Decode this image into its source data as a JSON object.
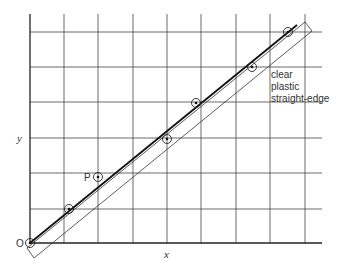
{
  "figure": {
    "type": "diagram",
    "axes": {
      "x_label": "x",
      "y_label": "y",
      "origin_label": "O"
    },
    "grid": {
      "x_lines": [
        30,
        64,
        98,
        133,
        167,
        201,
        236,
        270,
        305
      ],
      "y_lines": [
        32,
        67,
        102,
        138,
        173,
        209,
        243
      ],
      "right_edge": 322,
      "top_edge": 14
    },
    "points": [
      {
        "cx": 30,
        "cy": 243,
        "label": "O"
      },
      {
        "cx": 69,
        "cy": 209,
        "label": ""
      },
      {
        "cx": 98,
        "cy": 177,
        "label": "P"
      },
      {
        "cx": 167,
        "cy": 139,
        "label": ""
      },
      {
        "cx": 196,
        "cy": 103,
        "label": ""
      },
      {
        "cx": 252,
        "cy": 67,
        "label": ""
      },
      {
        "cx": 288,
        "cy": 32,
        "label": ""
      }
    ],
    "point_label_P": "P",
    "fit_line": {
      "x1": 30,
      "y1": 243,
      "x2": 297,
      "y2": 25
    },
    "straight_edge": {
      "label_lines": [
        "clear",
        "plastic",
        "straight-edge"
      ],
      "corners": [
        [
          27,
          248
        ],
        [
          305,
          22
        ],
        [
          312,
          31
        ],
        [
          34,
          258
        ]
      ]
    }
  }
}
